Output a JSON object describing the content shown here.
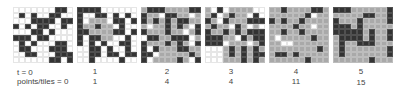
{
  "figure": {
    "row_labels": {
      "time": "t = 0",
      "points": "points/tiles = 0"
    },
    "colors": {
      "empty": "#ffffff",
      "visited": "#a9a9a9",
      "obstacle": "#333333"
    },
    "panels": [
      {
        "t": "t = 0",
        "points": "points/tiles = 0",
        "x": 13,
        "cells": [
          ".......XX.",
          ".X.X..XX..",
          "...XXXX.XX",
          "X.X.XX..X.",
          "...XX.X...",
          "XXX.XX....",
          ".X.X...XX.",
          ".XX...XXX.",
          "..XX...XXX",
          "......XX.X"
        ]
      },
      {
        "t": "1",
        "points": "1",
        "x": 77,
        "cells": [
          "XXXX......",
          "X..XX.X.X.",
          "X.ggg.XX.X",
          "XggXgg.X..",
          "XXggggXX.X",
          "X.XXgg..X.",
          "X.X.X..XX.",
          "..XX.X..X.",
          "..XX.XX.XX",
          "..X....X.."
        ]
      },
      {
        "t": "2",
        "points": "4",
        "x": 141,
        "cells": [
          "gXXXggggXX",
          "Xgg.XXgg.g",
          "XgXgXgXXgg",
          "g.ggXgXg.X",
          "XgggXgg.gX",
          ".XXggXXX.g",
          "XgggXgXg.X",
          "X.XgggXXgg",
          "XX.gggggXg",
          "X.ggggXg.X"
        ]
      },
      {
        "t": "3",
        "points": "4",
        "x": 205,
        "cells": [
          "g.X.gggg..",
          "gX.gXgg.X.",
          "Xg.XgggXXX",
          "gXgg.Xg.g.",
          "XggXgXgXXX",
          "XXXgg.XgXX",
          "XXX.ggg.gX",
          "...gXgXgXg",
          "...gXgXgXX",
          "...gggXgXg"
        ]
      },
      {
        "t": "4",
        "points": "11",
        "x": 269,
        "cells": [
          "ggXggggXXg",
          "ggggggX.gg",
          "XgXggXgggg",
          "ggggXgg.gg",
          "ggXggXgggg",
          "g.gggggXgg",
          "gg..gggggg",
          "ggggggggXg",
          "gXXgXggggg",
          "ggggggXggg"
        ]
      },
      {
        "t": "5",
        "points": "15",
        "x": 333,
        "cells": [
          "XXXggggggX",
          "gggggXXggX",
          "XgggXggggX",
          "XXXgXggggg",
          "XXXXXgXggX",
          "gXXXXgXggX",
          "gXggXXXggg",
          "gXgggggggX",
          "gXgggggggX",
          "ggggggXggg"
        ]
      }
    ]
  }
}
